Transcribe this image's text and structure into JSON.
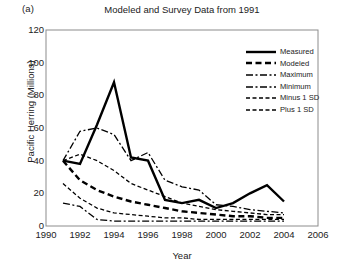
{
  "panel_label": "(a)",
  "chart_data": {
    "type": "line",
    "title": "Modeled and Survey Data from 1991",
    "xlabel": "Year",
    "ylabel": "Pacific Herring (Millions)",
    "xlim": [
      1990,
      2006
    ],
    "ylim": [
      0,
      120
    ],
    "xticks": [
      1990,
      1992,
      1994,
      1996,
      1998,
      2000,
      2002,
      2004,
      2006
    ],
    "yticks": [
      0,
      20,
      40,
      60,
      80,
      100,
      120
    ],
    "grid": false,
    "legend_position": "top-right",
    "series": [
      {
        "name": "Measured",
        "style": "solid",
        "color": "#000000",
        "x": [
          1991,
          1992,
          1993,
          1994,
          1995,
          1996,
          1997,
          1998,
          1999,
          2000,
          2001,
          2002,
          2003,
          2004
        ],
        "y": [
          40,
          38,
          62,
          88,
          42,
          40,
          16,
          14,
          16,
          11,
          14,
          20,
          25,
          15
        ]
      },
      {
        "name": "Modeled",
        "style": "dashed-bold",
        "color": "#000000",
        "x": [
          1991,
          1992,
          1993,
          1994,
          1995,
          1996,
          1997,
          1998,
          1999,
          2000,
          2001,
          2002,
          2003,
          2004
        ],
        "y": [
          40,
          28,
          22,
          18,
          15,
          13,
          11,
          9,
          8,
          7,
          6,
          6,
          5,
          5
        ]
      },
      {
        "name": "Maximum",
        "style": "dash-dot",
        "color": "#000000",
        "x": [
          1991,
          1992,
          1993,
          1994,
          1995,
          1996,
          1997,
          1998,
          1999,
          2000,
          2001,
          2002,
          2003,
          2004
        ],
        "y": [
          40,
          58,
          60,
          56,
          40,
          45,
          28,
          24,
          22,
          13,
          12,
          10,
          9,
          8
        ]
      },
      {
        "name": "Minimum",
        "style": "dash-dot",
        "color": "#000000",
        "x": [
          1991,
          1992,
          1993,
          1994,
          1995,
          1996,
          1997,
          1998,
          1999,
          2000,
          2001,
          2002,
          2003,
          2004
        ],
        "y": [
          14,
          12,
          4,
          3,
          3,
          3,
          3,
          3,
          3,
          3,
          3,
          3,
          3,
          3
        ]
      },
      {
        "name": "Minus 1 SD",
        "style": "dashed",
        "color": "#000000",
        "x": [
          1991,
          1992,
          1993,
          1994,
          1995,
          1996,
          1997,
          1998,
          1999,
          2000,
          2001,
          2002,
          2003,
          2004
        ],
        "y": [
          26,
          17,
          11,
          8,
          7,
          6,
          5,
          5,
          4,
          4,
          4,
          4,
          4,
          4
        ]
      },
      {
        "name": "Plus 1 SD",
        "style": "dashed",
        "color": "#000000",
        "x": [
          1991,
          1992,
          1993,
          1994,
          1995,
          1996,
          1997,
          1998,
          1999,
          2000,
          2001,
          2002,
          2003,
          2004
        ],
        "y": [
          40,
          44,
          40,
          34,
          26,
          22,
          18,
          14,
          12,
          10,
          9,
          8,
          7,
          7
        ]
      }
    ]
  },
  "legend": {
    "items": [
      {
        "label": "Measured"
      },
      {
        "label": "Modeled"
      },
      {
        "label": "Maximum"
      },
      {
        "label": "Minimum"
      },
      {
        "label": "Minus 1 SD"
      },
      {
        "label": "Plus 1 SD"
      }
    ]
  }
}
